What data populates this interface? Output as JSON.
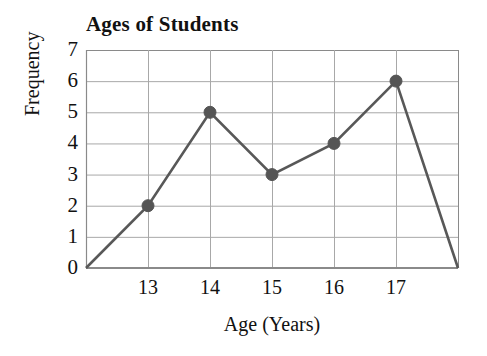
{
  "chart_data": {
    "type": "line",
    "title": "Ages of Students",
    "xlabel": "Age (Years)",
    "ylabel": "Frequency",
    "categories": [
      "13",
      "14",
      "15",
      "16",
      "17"
    ],
    "x": [
      13,
      14,
      15,
      16,
      17
    ],
    "values": [
      2,
      5,
      3,
      4,
      6
    ],
    "series": [
      {
        "name": "Frequency",
        "values": [
          2,
          5,
          3,
          4,
          6
        ]
      }
    ],
    "xtick_labels": [
      "13",
      "14",
      "15",
      "16",
      "17"
    ],
    "ytick_labels": [
      "0",
      "1",
      "2",
      "3",
      "4",
      "5",
      "6",
      "7"
    ],
    "ylim": [
      0,
      7
    ],
    "xlim": [
      12,
      18
    ],
    "xlim_labels": [
      "12",
      "18"
    ],
    "grid": true,
    "legend": "none",
    "markers": "filled-circle",
    "endpoints_drop_to_zero": true,
    "endpoint_values": [
      {
        "x": 12,
        "y": 0
      },
      {
        "x": 18,
        "y": 0
      }
    ],
    "colors": {
      "line": "#585858",
      "marker": "#555555",
      "grid": "#a8a8a8",
      "axis": "#8a8a8a",
      "background": "#ffffff",
      "text": "#111111"
    }
  }
}
